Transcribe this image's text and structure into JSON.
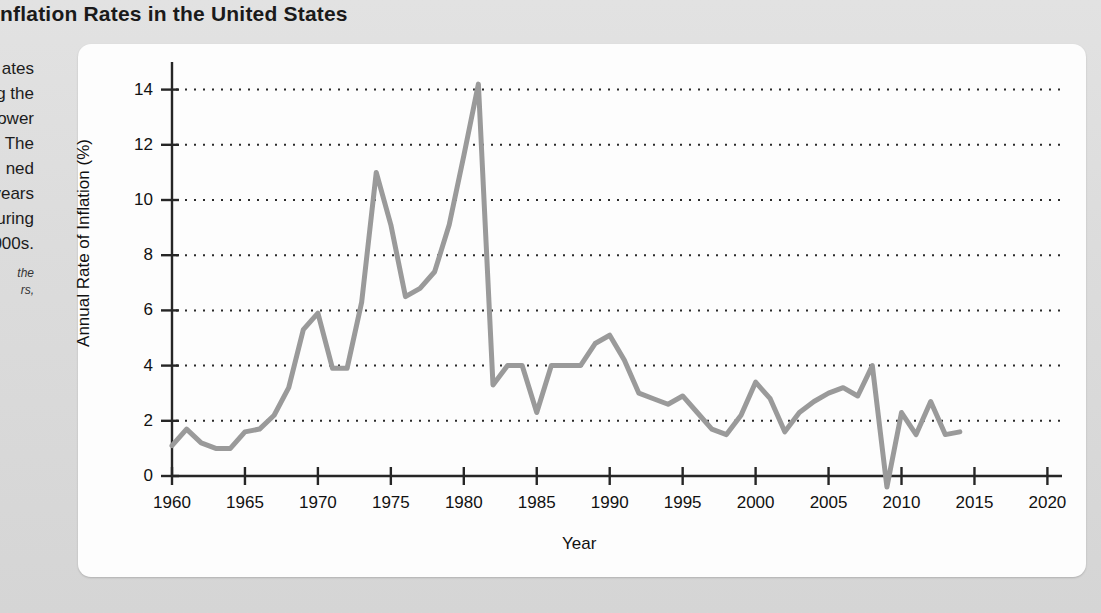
{
  "page": {
    "title": "Inflation Rates in the United States",
    "background_color": "#dcdcdc",
    "card_color": "#fdfdfd"
  },
  "sidebar": {
    "lines": [
      "ates",
      "g the",
      "lower",
      "The",
      "ned",
      "years",
      "during",
      "000s."
    ],
    "caption_lines": [
      "the",
      "rs,"
    ]
  },
  "chart_data": {
    "type": "line",
    "title": "Inflation Rates in the United States",
    "xlabel": "Year",
    "ylabel": "Annual Rate of Inflation (%)",
    "xlim": [
      1960,
      2021
    ],
    "ylim": [
      0,
      15
    ],
    "xticks": [
      1960,
      1965,
      1970,
      1975,
      1980,
      1985,
      1990,
      1995,
      2000,
      2005,
      2010,
      2015,
      2020
    ],
    "yticks": [
      0,
      2,
      4,
      6,
      8,
      10,
      12,
      14
    ],
    "grid": "horizontal-dotted",
    "legend": "none",
    "line_color": "#9a9a9a",
    "line_width": 5,
    "x": [
      1960,
      1961,
      1962,
      1963,
      1964,
      1965,
      1966,
      1967,
      1968,
      1969,
      1970,
      1971,
      1972,
      1973,
      1974,
      1975,
      1976,
      1977,
      1978,
      1979,
      1980,
      1981,
      1982,
      1983,
      1984,
      1985,
      1986,
      1987,
      1988,
      1989,
      1990,
      1991,
      1992,
      1993,
      1994,
      1995,
      1996,
      1997,
      1998,
      1999,
      2000,
      2001,
      2002,
      2003,
      2004,
      2005,
      2006,
      2007,
      2008,
      2009,
      2010,
      2011,
      2012,
      2013,
      2014
    ],
    "values": [
      1.1,
      1.7,
      1.2,
      1.0,
      1.0,
      1.6,
      1.7,
      2.2,
      3.2,
      5.3,
      5.9,
      3.9,
      3.9,
      6.3,
      11.0,
      9.1,
      6.5,
      6.8,
      7.4,
      9.1,
      11.6,
      14.2,
      3.3,
      4.0,
      4.0,
      2.3,
      4.0,
      4.0,
      4.0,
      4.8,
      5.1,
      4.2,
      3.0,
      2.8,
      2.6,
      2.9,
      2.3,
      1.7,
      1.5,
      2.2,
      3.4,
      2.8,
      1.6,
      2.3,
      2.7,
      3.0,
      3.2,
      2.9,
      4.0,
      -0.4,
      2.3,
      1.5,
      2.7,
      1.5,
      1.6
    ]
  }
}
